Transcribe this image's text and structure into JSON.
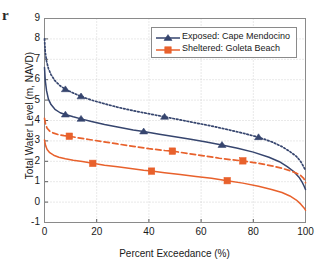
{
  "figure": {
    "caption_fragment": "r",
    "background_color": "#ffffff"
  },
  "chart_data": {
    "type": "line",
    "title": "",
    "xlabel": "Percent Exceedance (%)",
    "ylabel": "Total Water Level (m, NAVD)",
    "xlim": [
      0,
      100
    ],
    "ylim": [
      -1,
      9
    ],
    "xticks": [
      0,
      20,
      40,
      60,
      80,
      100
    ],
    "yticks": [
      -1,
      0,
      1,
      2,
      3,
      4,
      5,
      6,
      7,
      8,
      9
    ],
    "xtick_labels": [
      "0",
      "20",
      "40",
      "60",
      "80",
      "100"
    ],
    "ytick_labels": [
      "-1",
      "0",
      "1",
      "2",
      "3",
      "4",
      "5",
      "6",
      "7",
      "8",
      "9"
    ],
    "grid": true,
    "grid_style": "dotted",
    "grid_color": "#c8c8c8",
    "legend_position": "top-right",
    "colors": {
      "exposed": "#36456e",
      "sheltered": "#e8612c"
    },
    "series": [
      {
        "name": "Exposed: Cape Mendocino",
        "legend_label": "Exposed: Cape Mendocino",
        "in_legend": true,
        "color": "#36456e",
        "linestyle": "dotted",
        "marker": "triangle",
        "x": [
          0,
          0.3,
          0.8,
          1.5,
          2.5,
          4,
          6,
          8,
          11,
          14,
          18,
          23,
          28,
          34,
          40,
          46,
          52,
          58,
          64,
          70,
          76,
          82,
          87,
          91,
          94,
          96.5,
          98,
          99,
          99.5,
          100
        ],
        "y": [
          8.0,
          7.35,
          6.9,
          6.55,
          6.25,
          5.95,
          5.7,
          5.53,
          5.35,
          5.18,
          5.0,
          4.82,
          4.65,
          4.48,
          4.33,
          4.18,
          4.03,
          3.88,
          3.73,
          3.56,
          3.38,
          3.18,
          2.96,
          2.72,
          2.48,
          2.24,
          2.02,
          1.8,
          1.68,
          1.55
        ],
        "markers_x": [
          8,
          14,
          46,
          82
        ],
        "markers_y": [
          5.53,
          5.18,
          4.18,
          3.18
        ]
      },
      {
        "name": "Exposed: Cape Mendocino (still water)",
        "legend_label": "",
        "in_legend": false,
        "color": "#36456e",
        "linestyle": "solid",
        "marker": "triangle",
        "x": [
          0,
          0.3,
          0.8,
          1.5,
          2.5,
          4,
          6,
          8,
          11,
          14,
          18,
          23,
          28,
          34,
          38,
          44,
          50,
          56,
          62,
          68,
          74,
          80,
          86,
          90,
          93,
          95.5,
          97.5,
          98.7,
          99.4,
          100
        ],
        "y": [
          6.6,
          5.95,
          5.45,
          5.05,
          4.78,
          4.55,
          4.38,
          4.29,
          4.18,
          4.08,
          3.95,
          3.8,
          3.68,
          3.53,
          3.46,
          3.33,
          3.2,
          3.08,
          2.95,
          2.8,
          2.64,
          2.45,
          2.2,
          1.98,
          1.74,
          1.5,
          1.22,
          0.98,
          0.8,
          0.62
        ],
        "markers_x": [
          8,
          14,
          38,
          68
        ],
        "markers_y": [
          4.29,
          4.08,
          3.46,
          2.8
        ]
      },
      {
        "name": "Sheltered: Goleta Beach",
        "legend_label": "Sheltered: Goleta Beach",
        "in_legend": true,
        "color": "#e8612c",
        "linestyle": "dashed",
        "marker": "square",
        "x": [
          0,
          0.4,
          1,
          2,
          3.5,
          5.5,
          7.5,
          9.5,
          13,
          17,
          22,
          28,
          34,
          40,
          46,
          49,
          55,
          61,
          67,
          72,
          76,
          82,
          87,
          91,
          94,
          96.5,
          98.2,
          99.2,
          99.7,
          100
        ],
        "y": [
          4.1,
          3.82,
          3.62,
          3.48,
          3.38,
          3.3,
          3.26,
          3.23,
          3.15,
          3.07,
          2.97,
          2.85,
          2.73,
          2.62,
          2.53,
          2.5,
          2.38,
          2.27,
          2.15,
          2.07,
          2.02,
          1.9,
          1.78,
          1.66,
          1.54,
          1.42,
          1.3,
          1.18,
          1.08,
          0.95
        ],
        "markers_x": [
          9.5,
          49,
          76
        ],
        "markers_y": [
          3.23,
          2.5,
          2.02
        ]
      },
      {
        "name": "Sheltered: Goleta Beach (still water)",
        "legend_label": "",
        "in_legend": false,
        "color": "#e8612c",
        "linestyle": "solid",
        "marker": "square",
        "x": [
          0,
          0.4,
          1,
          2,
          3.5,
          5.5,
          8,
          11,
          14.5,
          18.5,
          23,
          28,
          33,
          38,
          41,
          46,
          52,
          58,
          64,
          70,
          76,
          82,
          87,
          91,
          94,
          96.5,
          98.2,
          99.2,
          99.7,
          100
        ],
        "y": [
          3.05,
          2.78,
          2.58,
          2.42,
          2.3,
          2.2,
          2.12,
          2.05,
          1.99,
          1.9,
          1.81,
          1.73,
          1.65,
          1.56,
          1.52,
          1.44,
          1.35,
          1.26,
          1.17,
          1.05,
          0.93,
          0.78,
          0.62,
          0.47,
          0.3,
          0.1,
          -0.1,
          -0.25,
          -0.33,
          -0.4
        ],
        "markers_x": [
          18.5,
          41,
          70
        ],
        "markers_y": [
          1.9,
          1.52,
          1.05
        ]
      }
    ]
  }
}
